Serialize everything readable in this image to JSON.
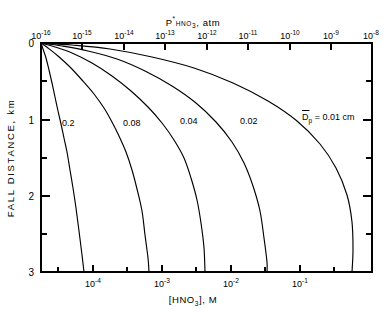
{
  "chart_data": {
    "type": "line",
    "title": "",
    "top_axis": {
      "label_main": "P",
      "label_superscript": "*",
      "label_subscript": "HNO",
      "label_subscript_num": "3",
      "label_units": ", atm",
      "full_label": "P*HNO3, atm",
      "tick_exponents": [
        -16,
        -15,
        -14,
        -13,
        -12,
        -11,
        -10,
        -9,
        -8
      ],
      "tick_labels": [
        "10-16",
        "10-15",
        "10-14",
        "10-13",
        "10-12",
        "10-11",
        "10-10",
        "10-9",
        "10-8"
      ],
      "tick_mantissa": "10",
      "range": [
        -16,
        -8
      ],
      "scale": "log"
    },
    "bottom_axis": {
      "label_open": "[",
      "label_main": "HNO",
      "label_subscript_num": "3",
      "label_close": "]",
      "label_units": ", M",
      "full_label": "[HNO3], M",
      "tick_exponents": [
        -4,
        -3,
        -2,
        -1
      ],
      "tick_labels": [
        "10-4",
        "10-3",
        "10-2",
        "10-1"
      ],
      "tick_mantissa": "10",
      "minor_exponents": [
        -5,
        -4.5,
        -3.5,
        -2.5,
        -1.5,
        -0.7
      ],
      "range": [
        -5.35,
        -0.55
      ],
      "scale": "log"
    },
    "y_axis": {
      "label": "FALL DISTANCE, km",
      "tick_labels": [
        "0",
        "1",
        "2",
        "3"
      ],
      "tick_values": [
        0,
        1,
        2,
        3
      ],
      "minor_tick_values": [
        0.5,
        1.5,
        2.5
      ],
      "range": [
        0,
        3
      ],
      "units": "km",
      "direction": "inverted"
    },
    "grid": false,
    "legend_position": "inline",
    "series": [
      {
        "name": "0.2",
        "label": "0.2",
        "label_x_px": 62,
        "label_y_px": 123,
        "points": [
          [
            41,
            43
          ],
          [
            43,
            49
          ],
          [
            46,
            58
          ],
          [
            49,
            70
          ],
          [
            52,
            83
          ],
          [
            55,
            97
          ],
          [
            58,
            111
          ],
          [
            61,
            124
          ],
          [
            64,
            138
          ],
          [
            67,
            152
          ],
          [
            70,
            170
          ],
          [
            73,
            188
          ],
          [
            76,
            208
          ],
          [
            79,
            231
          ],
          [
            82,
            255
          ],
          [
            84,
            272
          ]
        ]
      },
      {
        "name": "0.08",
        "label": "0.08",
        "label_x_px": 123,
        "label_y_px": 123,
        "points": [
          [
            41,
            43
          ],
          [
            48,
            48
          ],
          [
            58,
            56
          ],
          [
            70,
            67
          ],
          [
            82,
            80
          ],
          [
            94,
            94
          ],
          [
            104,
            108
          ],
          [
            112,
            122
          ],
          [
            119,
            136
          ],
          [
            126,
            152
          ],
          [
            132,
            170
          ],
          [
            137,
            189
          ],
          [
            142,
            211
          ],
          [
            145,
            235
          ],
          [
            148,
            258
          ],
          [
            149,
            272
          ]
        ]
      },
      {
        "name": "0.04",
        "label": "0.04",
        "label_x_px": 180,
        "label_y_px": 121,
        "points": [
          [
            41,
            43
          ],
          [
            55,
            47
          ],
          [
            72,
            53
          ],
          [
            92,
            63
          ],
          [
            112,
            76
          ],
          [
            131,
            91
          ],
          [
            148,
            107
          ],
          [
            162,
            123
          ],
          [
            174,
            140
          ],
          [
            184,
            158
          ],
          [
            191,
            178
          ],
          [
            197,
            200
          ],
          [
            201,
            223
          ],
          [
            204,
            248
          ],
          [
            205,
            272
          ]
        ]
      },
      {
        "name": "0.02",
        "label": "0.02",
        "label_x_px": 240,
        "label_y_px": 121,
        "points": [
          [
            41,
            43
          ],
          [
            62,
            46
          ],
          [
            88,
            51
          ],
          [
            117,
            59
          ],
          [
            145,
            71
          ],
          [
            172,
            86
          ],
          [
            196,
            103
          ],
          [
            216,
            122
          ],
          [
            232,
            142
          ],
          [
            244,
            163
          ],
          [
            253,
            186
          ],
          [
            260,
            211
          ],
          [
            264,
            238
          ],
          [
            267,
            262
          ],
          [
            267,
            272
          ]
        ]
      },
      {
        "name": "0.01",
        "label": "Dp = 0.01 cm",
        "label_prefix": "D",
        "label_subscript": "p",
        "label_suffix": " = 0.01 cm",
        "label_x_px": 302,
        "label_y_px": 117,
        "points": [
          [
            41,
            43
          ],
          [
            72,
            45
          ],
          [
            110,
            49
          ],
          [
            152,
            57
          ],
          [
            194,
            68
          ],
          [
            233,
            83
          ],
          [
            268,
            101
          ],
          [
            297,
            121
          ],
          [
            320,
            144
          ],
          [
            336,
            168
          ],
          [
            347,
            195
          ],
          [
            352,
            222
          ],
          [
            353,
            250
          ],
          [
            352,
            272
          ]
        ]
      }
    ]
  },
  "geometry": {
    "plot_left": 41,
    "plot_right": 372,
    "plot_top": 43,
    "plot_bottom": 272
  }
}
